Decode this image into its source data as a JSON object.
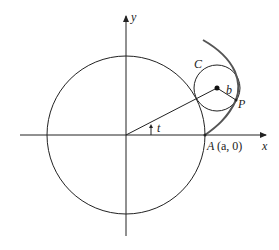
{
  "diagram": {
    "type": "epitrochoid-construction",
    "labels": {
      "x_axis": "x",
      "y_axis": "y",
      "angle": "t",
      "small_circle": "C",
      "radius": "b",
      "point": "P",
      "point_A_letter": "A",
      "point_A_coords": "(a, 0)"
    },
    "colors": {
      "stroke": "#222222",
      "curve": "#555555",
      "background": "#ffffff"
    },
    "geometry": {
      "origin": [
        126,
        135
      ],
      "big_circle_radius": 79,
      "small_circle_center": [
        217,
        88
      ],
      "small_circle_radius": 23,
      "point_P": [
        236,
        100
      ],
      "point_A": [
        205,
        135
      ]
    }
  }
}
